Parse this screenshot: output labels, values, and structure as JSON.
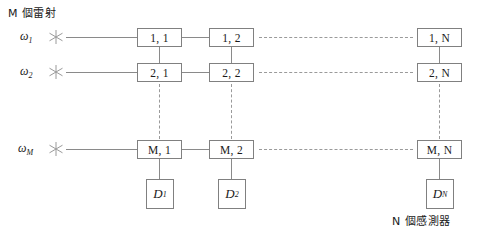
{
  "diagram": {
    "title_top_left": "M 個雷射",
    "title_bottom_right": "N 個感測器",
    "lasers": [
      {
        "label_base": "ω",
        "label_sub": "1",
        "icon": "laser-star-icon"
      },
      {
        "label_base": "ω",
        "label_sub": "2",
        "icon": "laser-star-icon"
      },
      {
        "label_base": "ω",
        "label_sub": "M",
        "icon": "laser-star-icon"
      }
    ],
    "nodes": [
      {
        "label": "1, 1"
      },
      {
        "label": "1, 2"
      },
      {
        "label": "1, N"
      },
      {
        "label": "2, 1"
      },
      {
        "label": "2, 2"
      },
      {
        "label": "2, N"
      },
      {
        "label": "M, 1"
      },
      {
        "label": "M, 2"
      },
      {
        "label": "M, N"
      }
    ],
    "detectors": [
      {
        "label_base": "D",
        "label_sub": "1"
      },
      {
        "label_base": "D",
        "label_sub": "2"
      },
      {
        "label_base": "D",
        "label_sub": "N"
      }
    ],
    "colors": {
      "line": "#8a8a8a",
      "dashed_line": "#9a9a9a",
      "box_border": "#808080",
      "text": "#1a1a1a",
      "background": "#ffffff"
    }
  }
}
